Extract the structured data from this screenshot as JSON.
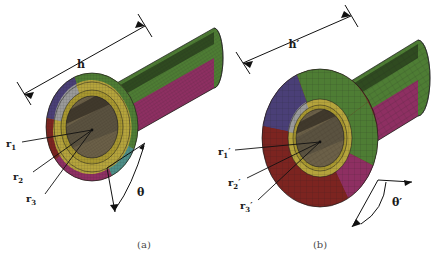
{
  "figure": {
    "background_color": "#ffffff",
    "panels": [
      {
        "id": "panel-a",
        "caption": "(a)",
        "description": "3D finite element mesh of hollow cylinder, fine mesh",
        "labels": {
          "height": "h",
          "radius_1": "r",
          "radius_1_sub": "1",
          "radius_2": "r",
          "radius_2_sub": "2",
          "radius_3": "r",
          "radius_3_sub": "3",
          "angle": "θ"
        }
      },
      {
        "id": "panel-b",
        "caption": "(b)",
        "description": "3D finite element mesh of hollow cylinder, coarse mesh, deformed",
        "labels": {
          "height": "h′",
          "radius_1": "r",
          "radius_1_sub": "1",
          "radius_1_prime": "′",
          "radius_2": "r",
          "radius_2_sub": "2",
          "radius_2_prime": "′",
          "radius_3": "r",
          "radius_3_sub": "3",
          "radius_3_prime": "′",
          "angle": "θ′"
        }
      }
    ],
    "colors": {
      "mesh_green": "#4e7d34",
      "mesh_green_dark": "#3d6228",
      "mesh_magenta": "#8e2f62",
      "mesh_magenta_dark": "#6d2049",
      "mesh_purple": "#4a3f77",
      "mesh_darkred": "#7c2420",
      "mesh_yellow": "#b5a43c",
      "mesh_olive": "#8f8330",
      "mesh_teal": "#4d8f88",
      "mesh_bore": "#6b6048",
      "mesh_grey": "#9a9a9a",
      "line": "#111111",
      "caption": "#4a4a4a"
    }
  }
}
